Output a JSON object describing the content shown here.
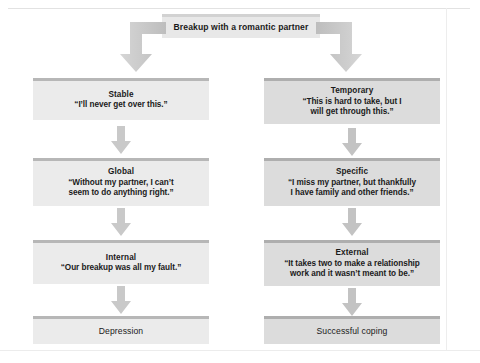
{
  "diagram": {
    "root": {
      "label": "Breakup with a romantic partner"
    },
    "columns": {
      "left": {
        "name": "Pessimistic attribution path",
        "nodes": [
          {
            "title": "Stable",
            "quote": "“I’ll never get over this.”"
          },
          {
            "title": "Global",
            "quote": "“Without my partner, I can’t\nseem to do anything right.”"
          },
          {
            "title": "Internal",
            "quote": "“Our breakup was all my fault.”"
          }
        ],
        "outcome": "Depression"
      },
      "right": {
        "name": "Optimistic attribution path",
        "nodes": [
          {
            "title": "Temporary",
            "quote": "“This is hard to take, but I\nwill get through this.”"
          },
          {
            "title": "Specific",
            "quote": "“I miss my partner, but thankfully\nI have family and other friends.”"
          },
          {
            "title": "External",
            "quote": "“It takes two to make a relationship\nwork and it wasn’t meant to be.”"
          }
        ],
        "outcome": "Successful coping"
      }
    },
    "icons": {
      "arrow_down": "down-arrow-icon",
      "elbow_left": "elbow-arrow-left-icon",
      "elbow_right": "elbow-arrow-right-icon"
    },
    "colors": {
      "box_left_fill": "#ebebeb",
      "box_right_fill": "#dcdcdc",
      "box_accent_bar": "#b7b7b7",
      "arrow_fill": "#c9c9c9",
      "text": "#1a1a1a",
      "background": "#ffffff"
    }
  }
}
